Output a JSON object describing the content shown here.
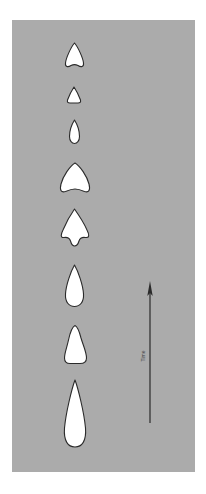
{
  "figure": {
    "colors": {
      "background": "#ffffff",
      "panel": "#ababab",
      "shape_fill": "#ffffff",
      "shape_stroke": "#2a2a2a",
      "arrow": "#2a2a2a"
    },
    "shapes": [
      {
        "id": "shape-1",
        "kind": "arrowhead-notched"
      },
      {
        "id": "shape-2",
        "kind": "small-triangle"
      },
      {
        "id": "shape-3",
        "kind": "small-teardrop"
      },
      {
        "id": "shape-4",
        "kind": "wide-arrowhead-notched"
      },
      {
        "id": "shape-5",
        "kind": "arrowhead-with-shoulders"
      },
      {
        "id": "shape-6",
        "kind": "teardrop"
      },
      {
        "id": "shape-7",
        "kind": "tapered-teardrop"
      },
      {
        "id": "shape-8",
        "kind": "long-teardrop"
      }
    ],
    "time_axis": {
      "label": "Time",
      "direction": "up"
    }
  }
}
